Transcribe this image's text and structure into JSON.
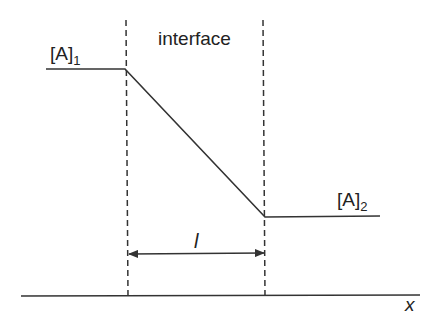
{
  "diagram": {
    "header_label": "interface",
    "left_concentration": {
      "base": "[A]",
      "subscript": "1"
    },
    "right_concentration": {
      "base": "[A]",
      "subscript": "2"
    },
    "thickness_label": "l",
    "axis_label": "x",
    "colors": {
      "line": "#333333",
      "text": "#222222",
      "background": "#ffffff"
    }
  }
}
